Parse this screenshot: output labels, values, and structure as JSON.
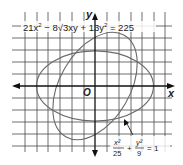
{
  "figure": {
    "equation_rotated": "21x² − 8√3xy + 13y² = 225",
    "equation_rotated_parts": [
      "21x",
      "2",
      " − 8",
      "√",
      "3xy + 13y",
      "2",
      " = 225"
    ],
    "equation_standard": {
      "num_left": "x²",
      "den_left": "25",
      "plus": "+",
      "num_right": "y²",
      "den_right": "9",
      "equals": "= 1"
    },
    "axes": {
      "x_label": "x",
      "y_label": "y",
      "origin_label": "O"
    },
    "grid": {
      "spacing_px": 11.7,
      "color": "#555555"
    },
    "curves": [
      {
        "name": "standard-ellipse",
        "equation": "x²/25 + y²/9 = 1",
        "a": 5,
        "b": 3,
        "rotation_deg": 0
      },
      {
        "name": "rotated-ellipse",
        "equation": "21x² − 8√3xy + 13y² = 225",
        "a": 5,
        "b": 3,
        "rotation_deg": 60
      }
    ],
    "colors": {
      "curve": "#6a6a6a",
      "axis": "#111111",
      "grid": "#4a4a4a"
    }
  }
}
